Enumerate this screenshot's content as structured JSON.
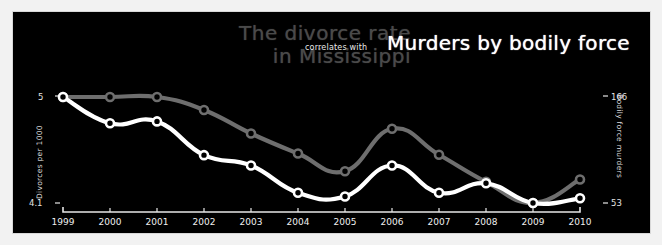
{
  "titles": {
    "left": "The divorce rate\nin Mississippi",
    "connector": "correlates with",
    "right": "Murders by bodily force"
  },
  "colors": {
    "background": "#000000",
    "frame": "#f2f2f2",
    "series_divorce": "#6e6e6e",
    "series_murders": "#ffffff",
    "axis": "#e6e6e6"
  },
  "axes": {
    "left": {
      "title": "Divorces per 1000",
      "top_tick": "5",
      "bottom_tick": "4.1"
    },
    "right": {
      "title": "Bodily force murders",
      "top_tick": "166",
      "bottom_tick": "53"
    }
  },
  "chart_data": {
    "type": "line",
    "title": "The divorce rate in Mississippi correlates with Murders by bodily force",
    "xlabel": "",
    "grid": false,
    "legend_position": "none",
    "categories": [
      "1999",
      "2000",
      "2001",
      "2002",
      "2003",
      "2004",
      "2005",
      "2006",
      "2007",
      "2008",
      "2009",
      "2010"
    ],
    "series": [
      {
        "name": "Divorces per 1000",
        "color": "#6e6e6e",
        "ylabel": "Divorces per 1000",
        "ylim": [
          4.1,
          5.0
        ],
        "ytick_labels": [
          "4.1",
          "5"
        ],
        "values": [
          5.0,
          5.0,
          5.0,
          4.89,
          4.69,
          4.52,
          4.37,
          4.73,
          4.51,
          4.28,
          4.1,
          4.3
        ]
      },
      {
        "name": "Bodily force murders",
        "color": "#ffffff",
        "ylabel": "Bodily force murders",
        "ylim": [
          53,
          166
        ],
        "ytick_labels": [
          "53",
          "166"
        ],
        "values": [
          166,
          138,
          140,
          104,
          93,
          64,
          60,
          93,
          64,
          74,
          53,
          58
        ]
      }
    ]
  }
}
